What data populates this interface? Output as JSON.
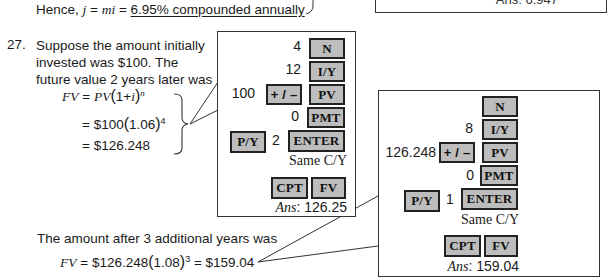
{
  "top": {
    "hence_prefix": "Hence, ",
    "j": "j",
    "eq1": " = ",
    "mi": "mi",
    "eq2": " = ",
    "result": "6.95% compounded annually",
    "prev_box_answer": "Ans: 6.947"
  },
  "problem": {
    "number": "27.",
    "lines": [
      "Suppose the amount initially",
      "invested was $100. The",
      "future value 2 years later was"
    ],
    "formula": {
      "line1_lhs": "FV",
      "line1_eq": " = ",
      "line1_rhs_pv": "PV",
      "line1_open": "(",
      "line1_inner": "1+",
      "line1_i": "i",
      "line1_close": ")",
      "line1_exp": "n",
      "line2_prefix": "= $100",
      "line2_open": "(",
      "line2_inner": "1.06",
      "line2_close": ")",
      "line2_exp": "4",
      "line3": "= $126.248"
    },
    "bottom_text": "The amount after 3 additional years was",
    "bottom_formula": {
      "lhs": "FV",
      "mid": " = $126.248",
      "open": "(",
      "inner": "1.08",
      "close": ")",
      "exp": "3",
      "rhs": " = $159.04"
    }
  },
  "calculator_1": {
    "rows": [
      {
        "value": "4",
        "key": "N"
      },
      {
        "value": "12",
        "key": "I/Y"
      },
      {
        "value": "100",
        "pre_key": "+ / –",
        "key": "PV"
      },
      {
        "value": "0",
        "key": "PMT"
      },
      {
        "pre_key": "P/Y",
        "value": "2",
        "key": "ENTER"
      }
    ],
    "note": "Same C/Y",
    "compute_keys": [
      "CPT",
      "FV"
    ],
    "answer_label": "Ans",
    "answer_value": ": 126.25"
  },
  "calculator_2": {
    "rows": [
      {
        "value": "3",
        "key": "N"
      },
      {
        "value": "8",
        "key": "I/Y"
      },
      {
        "value": "126.248",
        "pre_key": "+ / –",
        "key": "PV"
      },
      {
        "value": "0",
        "key": "PMT"
      },
      {
        "pre_key": "P/Y",
        "value": "1",
        "key": "ENTER"
      }
    ],
    "note": "Same C/Y",
    "compute_keys": [
      "CPT",
      "FV"
    ],
    "answer_label": "Ans",
    "answer_value": ": 159.04"
  },
  "colors": {
    "key_fill": "#bdbdbd",
    "key_border": "#222222",
    "text": "#1a1a1a"
  }
}
